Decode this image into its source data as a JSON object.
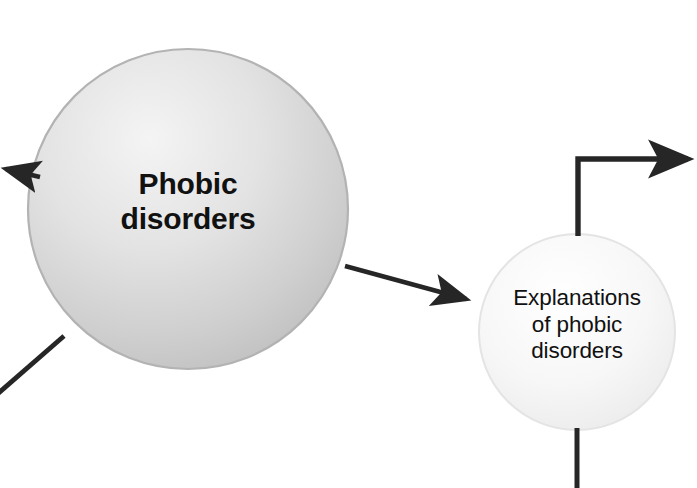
{
  "diagram": {
    "background_color": "#ffffff",
    "line_color": "#262626",
    "nodes": [
      {
        "id": "phobic-disorders",
        "label": "Phobic\ndisorders",
        "shape": "circle",
        "cx": 188,
        "cy": 209,
        "r": 160,
        "fill_light": "#f2f2f2",
        "fill_dark": "#c2c2c2",
        "border_color": "#b5b5b5",
        "text_weight": "bold",
        "text_size": 30
      },
      {
        "id": "explanations-of-phobic-disorders",
        "label": "Explanations\nof phobic\ndisorders",
        "shape": "circle",
        "cx": 577,
        "cy": 332,
        "r": 98,
        "fill_light": "#fdfdfd",
        "fill_dark": "#ebebeb",
        "border_color": "#e2e2e2",
        "text_weight": "normal",
        "text_size": 22.5
      }
    ],
    "connectors": [
      {
        "id": "phobic-to-explanations-arrow",
        "kind": "straight-arrow",
        "from": "phobic-disorders",
        "to": "explanations-of-phobic-disorders",
        "x1": 345,
        "y1": 266,
        "x2": 470,
        "y2": 300,
        "has_arrowhead": true
      },
      {
        "id": "explanations-top-elbow-arrow",
        "kind": "elbow-arrow",
        "from": "explanations-of-phobic-disorders",
        "to": "offscreen-right",
        "x1": 578,
        "y1": 236,
        "x2": 578,
        "y2": 159,
        "x3": 697,
        "y3": 159,
        "has_arrowhead": true
      },
      {
        "id": "explanations-bottom-line",
        "kind": "straight-line",
        "from": "explanations-of-phobic-disorders",
        "to": "offscreen-bottom",
        "x1": 577,
        "y1": 430,
        "x2": 577,
        "y2": 488,
        "has_arrowhead": false
      },
      {
        "id": "phobic-left-arrow",
        "kind": "straight-arrow",
        "from": "phobic-disorders",
        "to": "offscreen-left",
        "x1": 36,
        "y1": 176,
        "x2": 0,
        "y2": 168,
        "has_arrowhead": true
      },
      {
        "id": "phobic-bottom-left-line",
        "kind": "straight-line",
        "from": "phobic-disorders",
        "to": "offscreen-bottom-left",
        "x1": 63,
        "y1": 337,
        "x2": 0,
        "y2": 392,
        "has_arrowhead": false
      }
    ]
  }
}
